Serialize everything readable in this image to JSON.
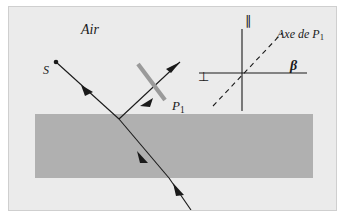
{
  "figure": {
    "background_color": "#ebebeb",
    "border_color": "#cfcfcf",
    "slab_color": "#b0b0b0",
    "ray_color": "#1a1a1a",
    "polarizer_color": "#9a9a9a"
  },
  "labels": {
    "medium_air": "Air",
    "source": "S",
    "polarizer": "P",
    "polarizer_subscript": "1",
    "perpendicular_symbol": "⊥",
    "parallel_symbol": "∥",
    "axis_label": "Axe de P",
    "axis_label_subscript": "1",
    "angle_beta": "β"
  },
  "geometry": {
    "slab": {
      "x": 34,
      "y": 113,
      "width": 278,
      "height": 64
    },
    "source_point": {
      "x": 55,
      "y": 61
    },
    "interface_point": {
      "x": 118,
      "y": 118
    },
    "incident_ray": {
      "from": [
        55,
        61
      ],
      "to": [
        118,
        118
      ]
    },
    "reflected_ray": {
      "from": [
        118,
        118
      ],
      "to": [
        177,
        62
      ]
    },
    "refracted_ray": {
      "from": [
        118,
        118
      ],
      "to": [
        168,
        177
      ]
    },
    "exit_ray": {
      "from": [
        168,
        177
      ],
      "to": [
        188,
        209
      ]
    },
    "polarizer_bar": {
      "from": [
        137,
        63
      ],
      "to": [
        163,
        99
      ]
    },
    "inset_origin": {
      "x": 241,
      "y": 72
    },
    "inset_horizontal": {
      "from": [
        198,
        72
      ],
      "to": [
        306,
        72
      ]
    },
    "inset_vertical": {
      "from": [
        241,
        18
      ],
      "to": [
        241,
        110
      ]
    },
    "inset_dashed_axis": {
      "from": [
        212,
        105
      ],
      "to": [
        281,
        32
      ]
    }
  }
}
